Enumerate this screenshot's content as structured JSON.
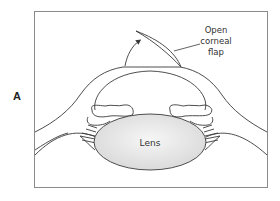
{
  "figure": {
    "panel_label": "A",
    "callout": {
      "lines": [
        "Open",
        "corneal",
        "flap"
      ]
    },
    "structures": {
      "lens_label": "Lens"
    },
    "colors": {
      "stroke": "#3a3a3a",
      "frame": "#8a8a8a",
      "lens_fill": "#e4e4e4",
      "background": "#ffffff"
    }
  }
}
